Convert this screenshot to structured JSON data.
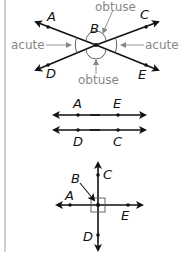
{
  "figure1": {
    "points": {
      "A": "A",
      "B": "B",
      "C": "C",
      "D": "D",
      "E": "E"
    },
    "angle_labels": {
      "obtuse_top": "obtuse",
      "obtuse_bottom": "obtuse",
      "acute_left": "acute",
      "acute_right": "acute"
    }
  },
  "figure2": {
    "points": {
      "A": "A",
      "E": "E",
      "D": "D",
      "C": "C"
    }
  },
  "figure3": {
    "points": {
      "A": "A",
      "B": "B",
      "C": "C",
      "D": "D",
      "E": "E"
    }
  },
  "colors": {
    "line": "#111111",
    "annotation": "#888888",
    "left_bar": "#cfcfcf"
  }
}
